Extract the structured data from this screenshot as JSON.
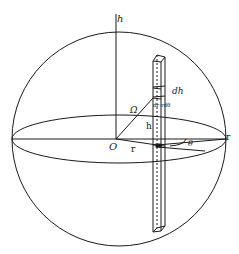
{
  "diagram": {
    "type": "geometric-figure",
    "labels": {
      "axis_h": "h",
      "origin": "O",
      "radius_r": "r",
      "sphere_edge_r": "r",
      "angle_theta": "θ",
      "omega": "Ω",
      "height_h": "h",
      "dh": "dh",
      "area_element": "dr·rdθ"
    },
    "colors": {
      "line": "#1a1a1a",
      "background": "#ffffff"
    }
  }
}
